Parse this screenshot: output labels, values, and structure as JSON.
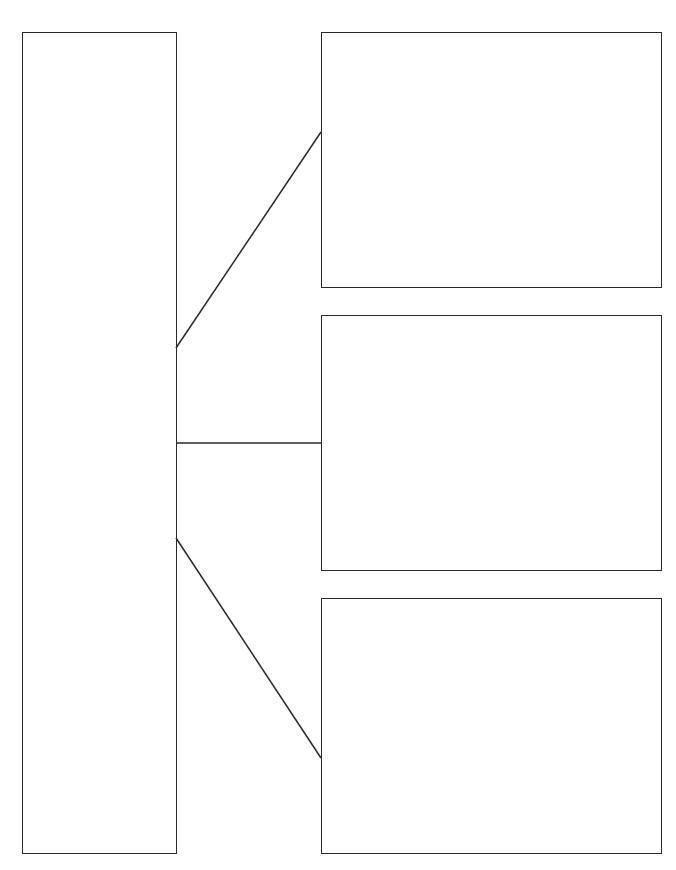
{
  "organizer": {
    "type": "blank-graphic-organizer",
    "line_color": "#2a2a2a",
    "background": "#ffffff",
    "main_box": {
      "text": ""
    },
    "detail_boxes": [
      {
        "text": ""
      },
      {
        "text": ""
      },
      {
        "text": ""
      }
    ],
    "connectors": [
      {
        "from": "main_box",
        "to": "detail_boxes.0"
      },
      {
        "from": "main_box",
        "to": "detail_boxes.1"
      },
      {
        "from": "main_box",
        "to": "detail_boxes.2"
      }
    ]
  }
}
